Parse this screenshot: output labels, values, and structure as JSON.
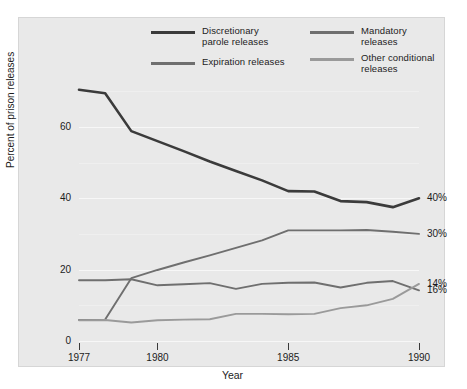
{
  "chart_data": {
    "type": "line",
    "title": "",
    "xlabel": "Year",
    "ylabel": "Percent of prison releases",
    "x": [
      1977,
      1978,
      1979,
      1980,
      1981,
      1982,
      1983,
      1984,
      1985,
      1986,
      1987,
      1988,
      1989,
      1990
    ],
    "xlim": [
      1977,
      1990
    ],
    "ylim": [
      0,
      72
    ],
    "yticks": [
      0,
      20,
      40,
      60
    ],
    "ytick_labels": [
      "0",
      "20",
      "40",
      "60"
    ],
    "xticks": [
      1977,
      1980,
      1985,
      1990
    ],
    "xtick_labels": [
      "1977",
      "1980",
      "1985",
      "1990"
    ],
    "grid": true,
    "legend_position": "top",
    "series": [
      {
        "name": "Discretionary\nparole releases",
        "legend_label": "Discretionary parole releases",
        "color": "#3b3b3b",
        "width": 2.6,
        "end_label": "40%",
        "values": [
          70.4,
          69.4,
          58.8,
          56.0,
          53.2,
          50.3,
          47.6,
          45.0,
          42.0,
          41.9,
          39.2,
          38.9,
          37.5,
          40.0
        ]
      },
      {
        "name": "Mandatory releases",
        "legend_label": "Mandatory releases",
        "color": "#6f6f6f",
        "width": 1.9,
        "end_label": "16%",
        "values": [
          17.0,
          17.0,
          17.3,
          15.6,
          15.9,
          16.2,
          14.6,
          16.0,
          16.3,
          16.4,
          15.0,
          16.3,
          16.8,
          14.2
        ]
      },
      {
        "name": "Expiration releases",
        "legend_label": "Expiration releases",
        "color": "#6f6f6f",
        "width": 1.9,
        "end_label": "30%",
        "values": [
          5.9,
          6.0,
          17.6,
          19.9,
          22.0,
          24.0,
          26.1,
          28.2,
          31.0,
          31.0,
          31.0,
          31.1,
          30.6,
          30.0
        ]
      },
      {
        "name": "Other conditional\nreleases",
        "legend_label": "Other conditional releases",
        "color": "#9a9a9a",
        "width": 1.9,
        "end_label": "14%",
        "values": [
          5.8,
          5.9,
          5.2,
          5.8,
          6.0,
          6.1,
          7.6,
          7.6,
          7.5,
          7.6,
          9.2,
          10.0,
          11.8,
          16.0
        ]
      }
    ]
  },
  "legend": {
    "entries": [
      {
        "label": "Discretionary\nparole releases",
        "color": "#3b3b3b"
      },
      {
        "label": "Mandatory releases",
        "color": "#6f6f6f"
      },
      {
        "label": "Expiration releases",
        "color": "#6f6f6f"
      },
      {
        "label": "Other conditional\nreleases",
        "color": "#9a9a9a"
      }
    ]
  },
  "axes": {
    "y_title": "Percent of prison releases",
    "x_title": "Year",
    "y_labels": [
      "60",
      "40",
      "20",
      "0"
    ],
    "x_labels": [
      "1977",
      "1980",
      "1985",
      "1990"
    ]
  },
  "end_labels": [
    "40%",
    "30%",
    "16%",
    "14%"
  ],
  "colors": {
    "background": "#e9e9e9",
    "gridline": "#f7f7f7",
    "text": "#1c1c1c"
  }
}
